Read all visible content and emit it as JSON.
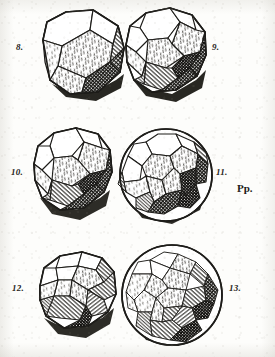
{
  "plate": {
    "title": "Plate of Archimedean solids",
    "background_color": "#fdfdfb",
    "ink_color": "#1d1c19",
    "plate_mark": "Pp.",
    "plate_mark_name": "plate-signature"
  },
  "figures": [
    {
      "number": "8.",
      "name": "truncated-octahedron",
      "label_position": "left",
      "shading": [
        "white",
        "stipple",
        "hatch",
        "crosshatch"
      ]
    },
    {
      "number": "9.",
      "name": "truncated-cuboctahedron",
      "label_position": "right",
      "shading": [
        "white",
        "stipple",
        "hatch",
        "crosshatch"
      ]
    },
    {
      "number": "10.",
      "name": "rhombicuboctahedron",
      "label_position": "left",
      "shading": [
        "white",
        "stipple",
        "hatch",
        "crosshatch"
      ]
    },
    {
      "number": "11.",
      "name": "rhombicosidodecahedron",
      "label_position": "right",
      "shading": [
        "white",
        "stipple",
        "hatch",
        "crosshatch"
      ]
    },
    {
      "number": "12.",
      "name": "snub-cube",
      "label_position": "left",
      "shading": [
        "white",
        "stipple",
        "hatch",
        "crosshatch"
      ]
    },
    {
      "number": "13.",
      "name": "snub-dodecahedron",
      "label_position": "right",
      "shading": [
        "white",
        "stipple",
        "hatch",
        "crosshatch"
      ]
    }
  ]
}
